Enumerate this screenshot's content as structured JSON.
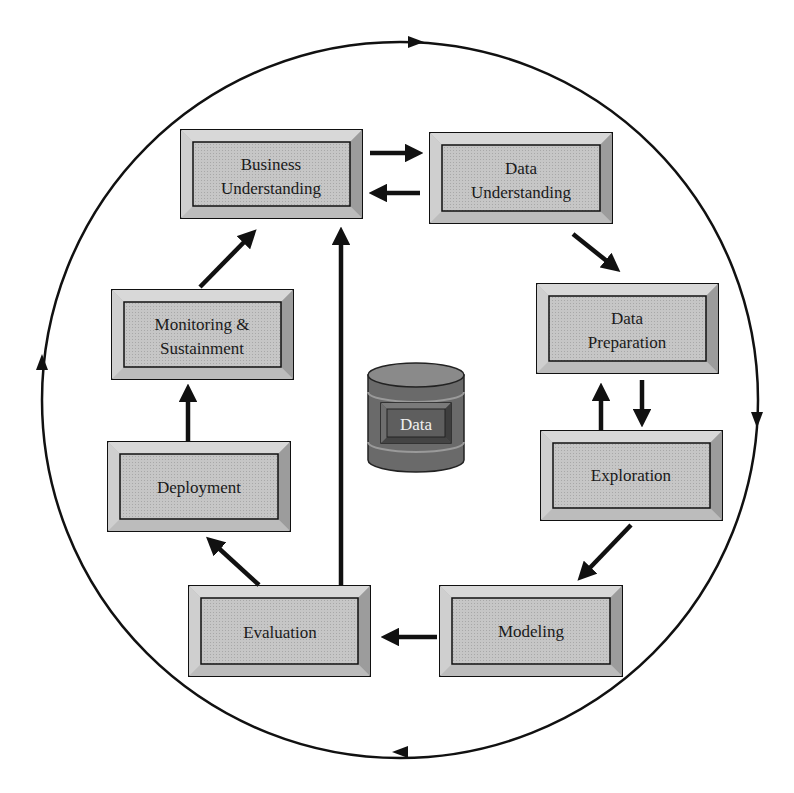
{
  "diagram": {
    "center": {
      "label": "Data",
      "shape": "database-cylinder"
    },
    "boxes": [
      {
        "id": "business",
        "line1": "Business",
        "line2": "Understanding"
      },
      {
        "id": "data-understanding",
        "line1": "Data",
        "line2": "Understanding"
      },
      {
        "id": "data-preparation",
        "line1": "Data",
        "line2": "Preparation"
      },
      {
        "id": "exploration",
        "line1": "Exploration",
        "line2": ""
      },
      {
        "id": "modeling",
        "line1": "Modeling",
        "line2": ""
      },
      {
        "id": "evaluation",
        "line1": "Evaluation",
        "line2": ""
      },
      {
        "id": "deployment",
        "line1": "Deployment",
        "line2": ""
      },
      {
        "id": "monitoring",
        "line1": "Monitoring &",
        "line2": "Sustainment"
      }
    ],
    "edges": [
      {
        "from": "business",
        "to": "data-understanding"
      },
      {
        "from": "data-understanding",
        "to": "business"
      },
      {
        "from": "data-understanding",
        "to": "data-preparation"
      },
      {
        "from": "data-preparation",
        "to": "exploration"
      },
      {
        "from": "exploration",
        "to": "data-preparation"
      },
      {
        "from": "exploration",
        "to": "modeling"
      },
      {
        "from": "modeling",
        "to": "evaluation"
      },
      {
        "from": "evaluation",
        "to": "deployment"
      },
      {
        "from": "evaluation",
        "to": "business"
      },
      {
        "from": "deployment",
        "to": "monitoring"
      },
      {
        "from": "monitoring",
        "to": "business"
      }
    ],
    "outer_cycle": {
      "direction": "clockwise",
      "arrowheads": 4
    },
    "colors": {
      "box_face": "#c8c8c8",
      "box_bevel_light": "#dcdcdc",
      "box_bevel_dark": "#9a9a9a",
      "stroke": "#111111",
      "cylinder": "#6e6e6e"
    }
  }
}
